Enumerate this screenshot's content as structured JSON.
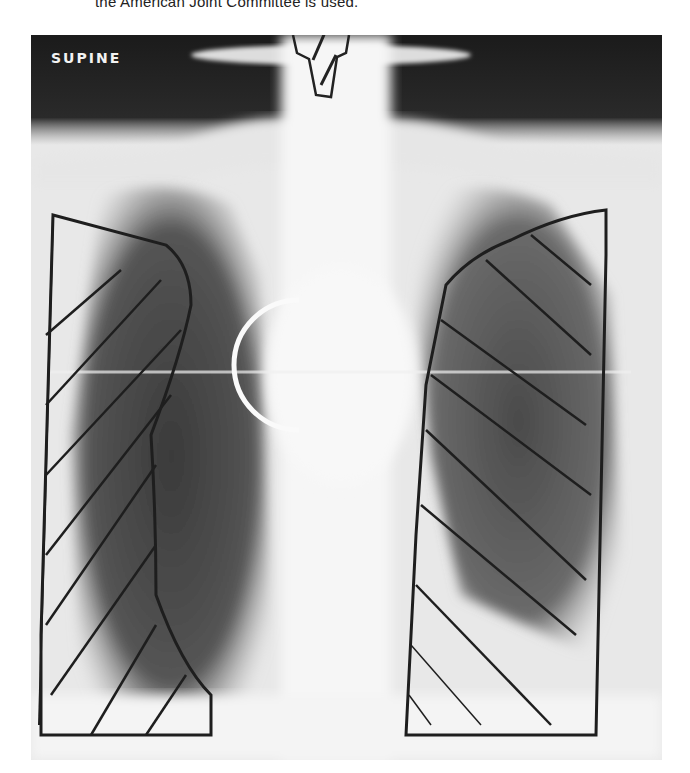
{
  "caption": {
    "text": "the American Joint Committee is used."
  },
  "radiograph": {
    "label": "SUPINE",
    "description": "Supine chest radiograph with hand-drawn radiation field outlines; hatched blocks over both lateral lung fields, a shielding block over the larynx, and a circular marker near the left hilum",
    "colors": {
      "background": "#f4f4f4",
      "dark": "#1e1e1e",
      "ink": "#222222"
    }
  }
}
